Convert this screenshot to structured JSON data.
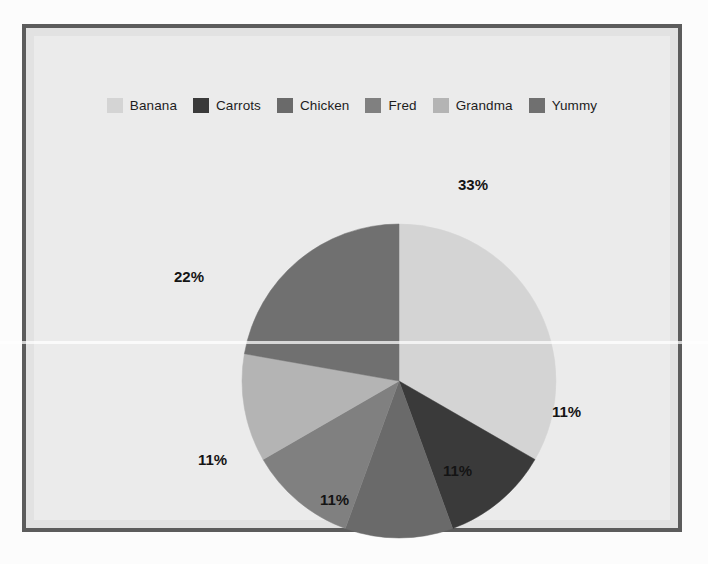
{
  "frame": {
    "border_color": "#5c5c5c",
    "panel_color": "#ebebeb",
    "page_background": "#fcfcfc"
  },
  "legend": {
    "position": "top-center",
    "items": [
      {
        "label": "Banana",
        "color": "#d4d4d4"
      },
      {
        "label": "Carrots",
        "color": "#3a3a3a"
      },
      {
        "label": "Chicken",
        "color": "#6a6a6a"
      },
      {
        "label": "Fred",
        "color": "#808080"
      },
      {
        "label": "Grandma",
        "color": "#b4b4b4"
      },
      {
        "label": "Yummy",
        "color": "#707070"
      }
    ]
  },
  "chart_data": {
    "type": "pie",
    "title": "",
    "categories": [
      "Banana",
      "Carrots",
      "Chicken",
      "Fred",
      "Grandma",
      "Yummy"
    ],
    "values": [
      33,
      11,
      11,
      11,
      11,
      22
    ],
    "value_unit": "%",
    "data_labels": [
      "33%",
      "11%",
      "11%",
      "11%",
      "11%",
      "22%"
    ],
    "colors": [
      "#d4d4d4",
      "#3a3a3a",
      "#6a6a6a",
      "#808080",
      "#b4b4b4",
      "#707070"
    ],
    "start_angle_deg": 0,
    "direction": "clockwise",
    "legend_position": "top",
    "grid": false
  },
  "labels": {
    "banana": "33%",
    "carrots": "11%",
    "chicken": "11%",
    "fred": "11%",
    "grandma": "11%",
    "yummy": "22%"
  }
}
